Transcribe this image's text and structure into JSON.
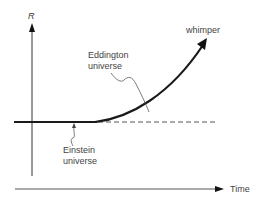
{
  "diagram": {
    "y_axis_label": "R",
    "x_axis_label": "Time",
    "curve_label": "whimper",
    "annotations": [
      {
        "line1": "Eddington",
        "line2": "universe"
      },
      {
        "line1": "Einstein",
        "line2": "universe"
      }
    ],
    "colors": {
      "line": "#1a1a1a",
      "axis": "#333333",
      "dash": "#555555",
      "text": "#444444"
    }
  }
}
